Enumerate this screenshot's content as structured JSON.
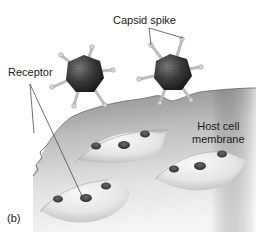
{
  "figure": {
    "panel_label": "(b)",
    "labels": {
      "capsid_spike": "Capsid spike",
      "receptor": "Receptor",
      "host_cell_line1": "Host cell",
      "host_cell_line2": "membrane"
    },
    "colors": {
      "membrane_top": "#8c8c8c",
      "membrane_bottom": "#f2f2f2",
      "virus_body": "#3a3a3a",
      "spike": "#b8b8b8",
      "receptor_spot": "#4a4a4a",
      "text": "#1a1a1a"
    },
    "elements": [
      {
        "type": "virus",
        "count": 2
      },
      {
        "type": "receptor-bump",
        "count": 3
      },
      {
        "type": "membrane",
        "count": 1
      }
    ]
  }
}
